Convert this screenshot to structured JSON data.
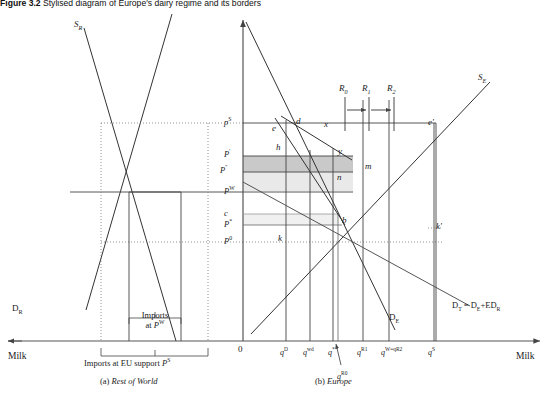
{
  "figure": {
    "title_bold": "Figure 3.2",
    "title_rest": "Stylised diagram of Europe's dairy regime and its borders"
  },
  "panels": {
    "left": {
      "caption_prefix": "(a)",
      "caption_name": "Rest of World",
      "axis_label": "Milk",
      "supply_curve": "S",
      "supply_sub": "R",
      "demand_curve": "D",
      "demand_sub": "R",
      "imports_pw_line1": "Imports",
      "imports_pw_line2": "at",
      "imports_pw_price": "P",
      "imports_pw_price_sup": "W",
      "imports_ps_text": "Imports at EU support",
      "imports_ps_price": "P",
      "imports_ps_price_sup": "S"
    },
    "right": {
      "caption_prefix": "(b)",
      "caption_name": "Europe",
      "axis_label": "Milk",
      "origin": "0",
      "supply_curve": "S",
      "supply_sub": "E",
      "demand_curve": "D",
      "demand_sub": "E",
      "total_demand": "D",
      "total_demand_sub": "T",
      "total_demand_eq": " = D",
      "total_demand_sub2": "E",
      "total_demand_plus": "+ED",
      "total_demand_sub3": "R"
    }
  },
  "price_axis": [
    {
      "id": "pS",
      "base": "p",
      "sup": "S",
      "y": 123
    },
    {
      "id": "Pp",
      "base": "P",
      "sup": "'",
      "y": 155
    },
    {
      "id": "Ppp",
      "base": "P",
      "sup": "''",
      "y": 171
    },
    {
      "id": "PW",
      "base": "P",
      "sup": "W",
      "y": 192
    },
    {
      "id": "c",
      "base": "c",
      "sup": "",
      "y": 214
    },
    {
      "id": "Pst",
      "base": "P",
      "sup": "*",
      "y": 225
    },
    {
      "id": "P0",
      "base": "P",
      "sup": "0",
      "y": 242
    }
  ],
  "quantity_axis": [
    {
      "base": "q",
      "sup": "D",
      "x": 285
    },
    {
      "base": "q",
      "sup": "wd",
      "x": 308
    },
    {
      "base": "q",
      "sup": "*",
      "x": 333
    },
    {
      "base": "q",
      "sup": "R1",
      "x": 362
    },
    {
      "base": "q",
      "sup": "W=q",
      "sup2": "R2",
      "x": 386
    },
    {
      "base": "q",
      "sup": "S",
      "x": 433
    }
  ],
  "quota_label": {
    "base": "q",
    "sup": "R0",
    "x": 337,
    "y": 371
  },
  "quota_rails": [
    {
      "label": "R",
      "sub": "0",
      "x": 345
    },
    {
      "label": "R",
      "sub": "1",
      "x": 368
    },
    {
      "label": "R",
      "sub": "2",
      "x": 393
    }
  ],
  "point_labels": [
    {
      "text": "e",
      "x": 272,
      "y": 124
    },
    {
      "text": "d",
      "x": 296,
      "y": 117
    },
    {
      "text": "x",
      "x": 324,
      "y": 120
    },
    {
      "text": "e'",
      "x": 428,
      "y": 118
    },
    {
      "text": "h",
      "x": 276,
      "y": 143
    },
    {
      "text": "y",
      "x": 338,
      "y": 147
    },
    {
      "text": "m",
      "x": 365,
      "y": 162
    },
    {
      "text": "n",
      "x": 337,
      "y": 173
    },
    {
      "text": "b",
      "x": 342,
      "y": 216
    },
    {
      "text": "k",
      "x": 278,
      "y": 234
    },
    {
      "text": "k'",
      "x": 436,
      "y": 222
    }
  ],
  "colors": {
    "line": "#333333",
    "shade_dark": "#c9c9c9",
    "shade_light": "#e6e6e6",
    "axis": "#555555"
  }
}
